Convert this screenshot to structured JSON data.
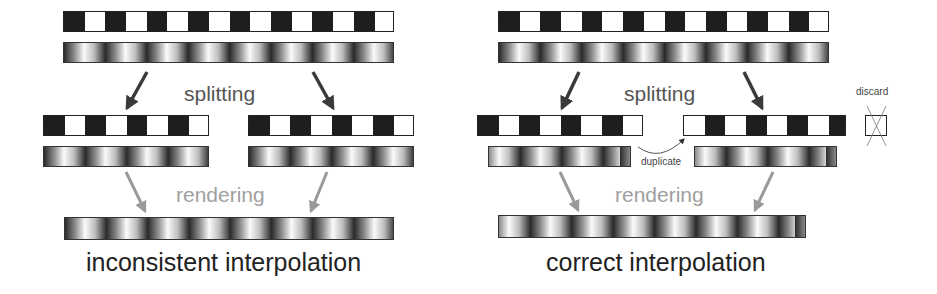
{
  "left_panel": {
    "split_label": "splitting",
    "render_label": "rendering",
    "caption": "inconsistent interpolation"
  },
  "right_panel": {
    "split_label": "splitting",
    "render_label": "rendering",
    "caption": "correct interpolation",
    "duplicate_label": "duplicate",
    "discard_label": "discard"
  },
  "colors": {
    "dark": "#1e1e1e",
    "light": "#ffffff",
    "split_arrow": "#3a3a3a",
    "render_arrow": "#9a9a9a"
  }
}
